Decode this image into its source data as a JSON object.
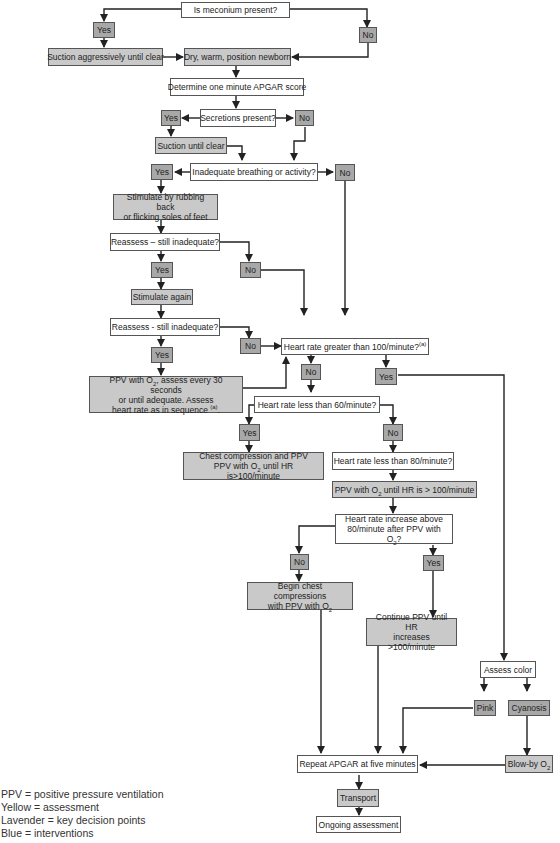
{
  "nodes": {
    "meconium_q": "Is meconium present?",
    "meconium_yes": "Yes",
    "meconium_no": "No",
    "suction_aggr": "Suction aggressively until clear",
    "dry_warm": "Dry, warm, position newborn",
    "apgar1": "Determine one minute APGAR score",
    "secretions_q": "Secretions present?",
    "secretions_yes": "Yes",
    "secretions_no": "No",
    "suction_clear": "Suction until clear",
    "inadequate_q": "Inadequate breathing or activity?",
    "inadequate_yes": "Yes",
    "inadequate_no": "No",
    "stimulate_l1": "Stimulate by rubbing back",
    "stimulate_l2": "or flicking soles of feet",
    "reassess1_q": "Reassess – still inadequate?",
    "reassess1_yes": "Yes",
    "reassess1_no": "No",
    "stimulate_again": "Stimulate again",
    "reassess2_q": "Reassess - still inadequate?",
    "reassess2_yes": "Yes",
    "reassess2_no": "No",
    "ppv_l1a": "PPV with O",
    "ppv_l1sub": "2",
    "ppv_l1b": ", assess every 30 seconds",
    "ppv_l2": "or until adequate. Assess",
    "ppv_l3": "heart rate as in sequence ",
    "ppv_l3sup": "(a)",
    "ppv_l3end": ".",
    "hr100_q": "Heart rate greater than 100/minute?",
    "hr100_sup": "(a)",
    "hr100_no": "No",
    "hr100_yes": "Yes",
    "hr60_q": "Heart rate less than 60/minute?",
    "hr60_yes": "Yes",
    "hr60_no": "No",
    "chest_l1": "Chest compression and PPV",
    "chest_l2a": "PPV with O",
    "chest_l2sub": "2",
    "chest_l2b": " until HR is>100/minute",
    "hr80_q": "Heart rate less than 80/minute?",
    "ppv80_a": "PPV with O",
    "ppv80_sub": "2",
    "ppv80_b": " until HR is > 100/minute",
    "hrinc_l1": "Heart rate increase above",
    "hrinc_l2a": "80/minute after PPV with O",
    "hrinc_l2sub": "2",
    "hrinc_l2b": "?",
    "hrinc_no": "No",
    "hrinc_yes": "Yes",
    "begin_chest_l1": "Begin chest compressions",
    "begin_chest_l2a": "with PPV with O",
    "begin_chest_l2sub": "2",
    "continue_l1": "Continue PPV until HR",
    "continue_l2": "increases >100/minute",
    "assess_color": "Assess color",
    "pink": "Pink",
    "cyanosis": "Cyanosis",
    "blowby_a": "Blow-by O",
    "blowby_sub": "2",
    "repeat_apgar": "Repeat APGAR at five minutes",
    "transport": "Transport",
    "ongoing": "Ongoing assessment"
  },
  "legend": {
    "line1": "PPV = positive pressure ventilation",
    "line2": "Yellow = assessment",
    "line3": "Lavender = key decision points",
    "line4": "Blue = interventions"
  },
  "colors": {
    "assessment": "#ffffff",
    "intervention": "#c9c9c9",
    "decision": "#a8a8a8",
    "line": "#222222"
  }
}
